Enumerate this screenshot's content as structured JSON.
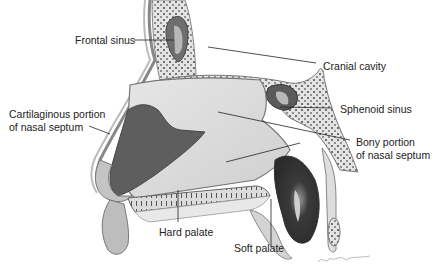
{
  "diagram": {
    "labels": [
      {
        "id": "frontal-sinus",
        "text": "Frontal sinus"
      },
      {
        "id": "cranial-cavity",
        "text": "Cranial cavity"
      },
      {
        "id": "sphenoid-sinus",
        "text": "Sphenoid sinus"
      },
      {
        "id": "cartilaginous-septum",
        "line1": "Cartilaginous portion",
        "line2": "of nasal septum"
      },
      {
        "id": "bony-septum",
        "line1": "Bony portion",
        "line2": "of nasal septum"
      },
      {
        "id": "hard-palate",
        "text": "Hard palate"
      },
      {
        "id": "soft-palate",
        "text": "Soft palate"
      }
    ],
    "signature": "S. Dyer Tomanu"
  }
}
